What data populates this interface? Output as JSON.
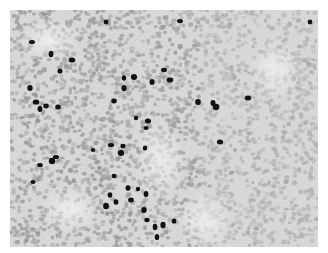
{
  "image": {
    "kind": "grayscale histology micrograph (immunostained tissue section)",
    "width": 308,
    "height": 237,
    "offset": [
      10,
      10
    ],
    "background_color": "#ffffff",
    "tissue_base_color": "#d8d8d8",
    "cell_color": "#a9a9a9",
    "stain_color": "#111111",
    "regions": [
      {
        "name": "dense-lymphoid-left",
        "x": [
          0,
          190
        ],
        "density": "high"
      },
      {
        "name": "fibrous-stroma-right",
        "x": [
          190,
          308
        ],
        "density": "medium",
        "feature": "dark reticular staining"
      }
    ],
    "dark_nuclei": [
      [
        22,
        32
      ],
      [
        96,
        12
      ],
      [
        62,
        50
      ],
      [
        114,
        68
      ],
      [
        114,
        78
      ],
      [
        124,
        67
      ],
      [
        142,
        72
      ],
      [
        160,
        70
      ],
      [
        154,
        60
      ],
      [
        20,
        78
      ],
      [
        26,
        92
      ],
      [
        36,
        96
      ],
      [
        48,
        97
      ],
      [
        30,
        99
      ],
      [
        104,
        91
      ],
      [
        126,
        108
      ],
      [
        138,
        111
      ],
      [
        136,
        118
      ],
      [
        41,
        44
      ],
      [
        50,
        61
      ],
      [
        188,
        92
      ],
      [
        203,
        93
      ],
      [
        46,
        147
      ],
      [
        42,
        151
      ],
      [
        30,
        155
      ],
      [
        23,
        172
      ],
      [
        104,
        166
      ],
      [
        100,
        185
      ],
      [
        106,
        192
      ],
      [
        96,
        196
      ],
      [
        118,
        178
      ],
      [
        128,
        179
      ],
      [
        136,
        184
      ],
      [
        134,
        200
      ],
      [
        137,
        210
      ],
      [
        145,
        217
      ],
      [
        147,
        227
      ],
      [
        153,
        215
      ],
      [
        83,
        140
      ],
      [
        101,
        135
      ],
      [
        113,
        136
      ],
      [
        111,
        143
      ],
      [
        135,
        138
      ],
      [
        121,
        190
      ],
      [
        164,
        211
      ],
      [
        238,
        88
      ],
      [
        210,
        132
      ],
      [
        206,
        97
      ],
      [
        170,
        11
      ],
      [
        300,
        12
      ]
    ]
  }
}
